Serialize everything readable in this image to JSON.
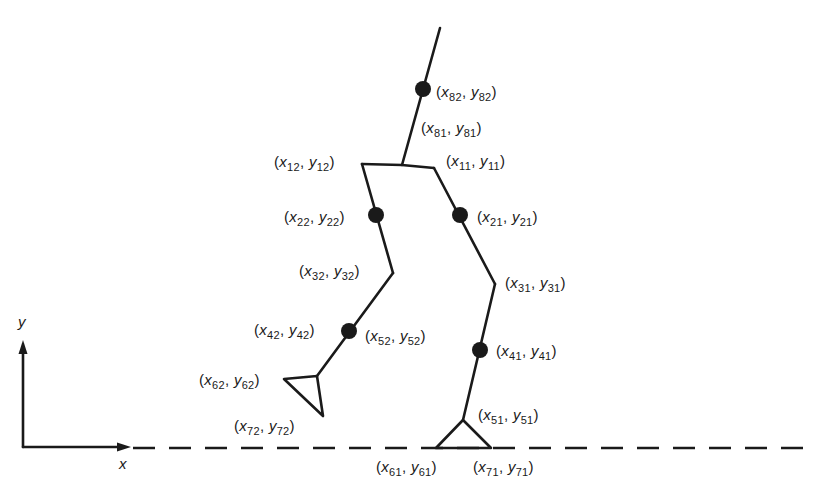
{
  "diagram": {
    "type": "biped-walking-model",
    "colors": {
      "stroke": "#1a1a1a",
      "background": "#ffffff"
    },
    "axes": {
      "x_label": "x",
      "y_label": "y"
    },
    "points": [
      {
        "id": "82",
        "label_x": "x",
        "sub_x": "82",
        "label_y": "y",
        "sub_y": "82",
        "joint_dot": true
      },
      {
        "id": "81",
        "label_x": "x",
        "sub_x": "81",
        "label_y": "y",
        "sub_y": "81",
        "joint_dot": false
      },
      {
        "id": "12",
        "label_x": "x",
        "sub_x": "12",
        "label_y": "y",
        "sub_y": "12",
        "joint_dot": false
      },
      {
        "id": "11",
        "label_x": "x",
        "sub_x": "11",
        "label_y": "y",
        "sub_y": "11",
        "joint_dot": false
      },
      {
        "id": "22",
        "label_x": "x",
        "sub_x": "22",
        "label_y": "y",
        "sub_y": "22",
        "joint_dot": true
      },
      {
        "id": "21",
        "label_x": "x",
        "sub_x": "21",
        "label_y": "y",
        "sub_y": "21",
        "joint_dot": true
      },
      {
        "id": "32",
        "label_x": "x",
        "sub_x": "32",
        "label_y": "y",
        "sub_y": "32",
        "joint_dot": false
      },
      {
        "id": "31",
        "label_x": "x",
        "sub_x": "31",
        "label_y": "y",
        "sub_y": "31",
        "joint_dot": false
      },
      {
        "id": "42",
        "label_x": "x",
        "sub_x": "42",
        "label_y": "y",
        "sub_y": "42",
        "joint_dot": true
      },
      {
        "id": "52",
        "label_x": "x",
        "sub_x": "52",
        "label_y": "y",
        "sub_y": "52",
        "joint_dot": false
      },
      {
        "id": "41",
        "label_x": "x",
        "sub_x": "41",
        "label_y": "y",
        "sub_y": "41",
        "joint_dot": true
      },
      {
        "id": "62",
        "label_x": "x",
        "sub_x": "62",
        "label_y": "y",
        "sub_y": "62",
        "joint_dot": false
      },
      {
        "id": "72",
        "label_x": "x",
        "sub_x": "72",
        "label_y": "y",
        "sub_y": "72",
        "joint_dot": false
      },
      {
        "id": "51",
        "label_x": "x",
        "sub_x": "51",
        "label_y": "y",
        "sub_y": "51",
        "joint_dot": false
      },
      {
        "id": "61",
        "label_x": "x",
        "sub_x": "61",
        "label_y": "y",
        "sub_y": "61",
        "joint_dot": false
      },
      {
        "id": "71",
        "label_x": "x",
        "sub_x": "71",
        "label_y": "y",
        "sub_y": "71",
        "joint_dot": false
      }
    ]
  }
}
